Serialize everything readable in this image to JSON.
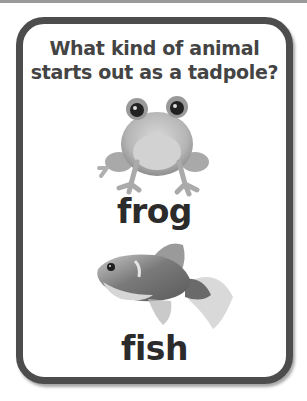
{
  "card": {
    "question": "What kind of animal starts out as a tadpole?",
    "question_line1": "What kind of animal",
    "question_line2": "starts out as a tadpole?",
    "options": [
      {
        "label": "frog",
        "image": "frog-photo"
      },
      {
        "label": "fish",
        "image": "goldfish-photo"
      }
    ]
  },
  "colors": {
    "border": "#4d4d4d",
    "question_text": "#444444",
    "answer_text": "#2b2b2b",
    "background": "#ffffff"
  }
}
